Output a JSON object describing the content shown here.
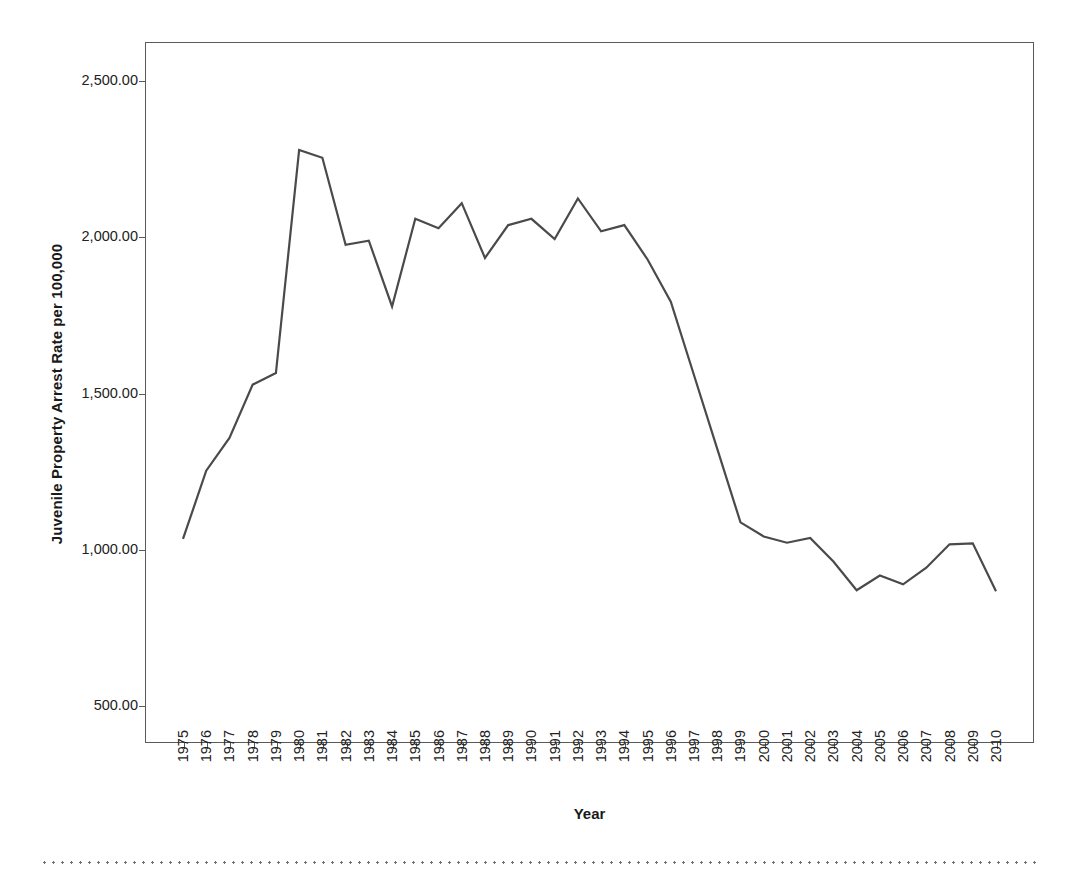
{
  "chart_data": {
    "type": "line",
    "title": "",
    "xlabel": "Year",
    "ylabel": "Juvenile Property Arrest Rate per 100,000",
    "x": [
      1975,
      1976,
      1977,
      1978,
      1979,
      1980,
      1981,
      1982,
      1983,
      1984,
      1985,
      1986,
      1987,
      1988,
      1989,
      1990,
      1991,
      1992,
      1993,
      1994,
      1995,
      1996,
      1997,
      1998,
      1999,
      2000,
      2001,
      2002,
      2003,
      2004,
      2005,
      2006,
      2007,
      2008,
      2009,
      2010
    ],
    "categories": [
      "1975",
      "1976",
      "1977",
      "1978",
      "1979",
      "1980",
      "1981",
      "1982",
      "1983",
      "1984",
      "1985",
      "1986",
      "1987",
      "1988",
      "1989",
      "1990",
      "1991",
      "1992",
      "1993",
      "1994",
      "1995",
      "1996",
      "1997",
      "1998",
      "1999",
      "2000",
      "2001",
      "2002",
      "2003",
      "2004",
      "2005",
      "2006",
      "2007",
      "2008",
      "2009",
      "2010"
    ],
    "values": [
      1032,
      1250,
      1355,
      1525,
      1562,
      2275,
      2250,
      1972,
      1985,
      1775,
      2055,
      2025,
      2105,
      1930,
      2035,
      2055,
      1990,
      2120,
      2015,
      2035,
      1925,
      1790,
      1555,
      1320,
      1085,
      1040,
      1020,
      1035,
      960,
      868,
      915,
      887,
      940,
      1015,
      1018,
      865
    ],
    "series": [
      {
        "name": "Juvenile Property Arrest Rate",
        "color": "#4a4a4a",
        "values": [
          1032,
          1250,
          1355,
          1525,
          1562,
          2275,
          2250,
          1972,
          1985,
          1775,
          2055,
          2025,
          2105,
          1930,
          2035,
          2055,
          1990,
          2120,
          2015,
          2035,
          1925,
          1790,
          1555,
          1320,
          1085,
          1040,
          1020,
          1035,
          960,
          868,
          915,
          887,
          940,
          1015,
          1018,
          865
        ]
      }
    ],
    "ylim": [
      380,
      2620
    ],
    "yticks": [
      500,
      1000,
      1500,
      2000,
      2500
    ],
    "ytick_labels": [
      "500.00",
      "1,000.00",
      "1,500.00",
      "2,000.00",
      "2,500.00"
    ],
    "grid": false,
    "legend": "none",
    "line_color": "#4a4a4a",
    "axis_color": "#5a5a5a",
    "background": "#ffffff"
  }
}
